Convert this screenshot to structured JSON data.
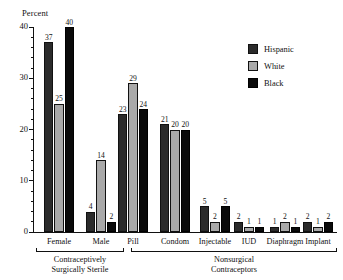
{
  "chart_data": {
    "type": "bar",
    "title": "",
    "xlabel": "",
    "ylabel": "Percent",
    "ylim": [
      0,
      40
    ],
    "yticks": [
      0,
      10,
      20,
      30,
      40
    ],
    "ytick_labels": [
      "0",
      "10",
      "20",
      "30",
      "40"
    ],
    "minor_tick_step": 2,
    "grid": false,
    "legend_position": "top-right",
    "categories": [
      "Female",
      "Male",
      "Pill",
      "Condom",
      "Injectable",
      "IUD",
      "Diaphragm",
      "Implant"
    ],
    "series": [
      {
        "name": "Hispanic",
        "color": "#2b2b2b",
        "values": [
          37,
          4,
          23,
          21,
          5,
          2,
          1,
          2
        ]
      },
      {
        "name": "White",
        "color": "#a9a9a9",
        "values": [
          25,
          14,
          29,
          20,
          2,
          1,
          2,
          1
        ]
      },
      {
        "name": "Black",
        "color": "#0a0a0a",
        "values": [
          40,
          2,
          24,
          20,
          5,
          1,
          1,
          2
        ]
      }
    ],
    "groups": [
      {
        "label": "Contraceptively\nSurgically Sterile",
        "line1": "Contraceptively",
        "line2": "Surgically Sterile",
        "categories": [
          "Female",
          "Male"
        ]
      },
      {
        "label": "Nonsurgical\nContraceptors",
        "line1": "Nonsurgical",
        "line2": "Contraceptors",
        "categories": [
          "Pill",
          "Condom",
          "Injectable",
          "IUD",
          "Diaphragm",
          "Implant"
        ]
      }
    ]
  },
  "legend": {
    "items": [
      {
        "label": "Hispanic"
      },
      {
        "label": "White"
      },
      {
        "label": "Black"
      }
    ]
  }
}
